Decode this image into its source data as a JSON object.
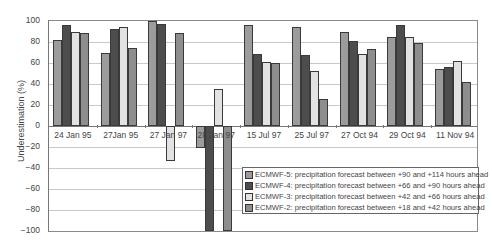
{
  "chart_data": {
    "type": "bar",
    "title": "",
    "xlabel": "",
    "ylabel": "Underestimation (%)",
    "ylim": [
      -100,
      100
    ],
    "yticks": [
      100,
      80,
      60,
      40,
      20,
      0,
      -20,
      -40,
      -60,
      -80,
      -100
    ],
    "grid": true,
    "legend_position": "lower right inside",
    "categories": [
      "24 Jan 95",
      "27Jan 95",
      "27 Jan 97",
      "28 Jan 97",
      "15 Jul 97",
      "25 Jul 97",
      "27 Oct 94",
      "29 Oct 94",
      "11 Nov 94"
    ],
    "series": [
      {
        "name": "ECMWF-5: precipitation forecast between +90 and +114 hours ahead",
        "color": "#9c9c9c",
        "values": [
          82,
          70,
          100,
          -21,
          96,
          94,
          90,
          85,
          54
        ]
      },
      {
        "name": "ECMWF-4: precipitation forecast between +66 and +90 hours ahead",
        "color": "#4d4d4d",
        "values": [
          96,
          92,
          97,
          -100,
          69,
          68,
          81,
          96,
          56
        ]
      },
      {
        "name": "ECMWF-3: precipitation forecast between +42 and +66 hours ahead",
        "color": "#e2e2e2",
        "values": [
          90,
          94,
          -33,
          35,
          61,
          52,
          69,
          85,
          62
        ]
      },
      {
        "name": "ECMWF-2: precipitation forecast between +18 and +42 hours ahead",
        "color": "#8e8e8e",
        "values": [
          89,
          74,
          89,
          -100,
          60,
          26,
          73,
          79,
          42
        ]
      }
    ]
  }
}
